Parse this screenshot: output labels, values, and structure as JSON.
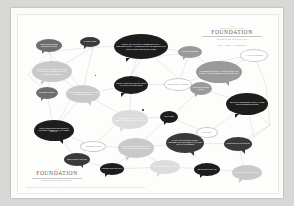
{
  "poster": {
    "header": {
      "logo_kicker": "THE",
      "logo_kicker2": "SOCIETY OF SHARED",
      "logo_word": "FOUNDATION",
      "logo_sub": "CONNECTING COMMUNITIES",
      "report_line": "2014 ANNUAL REPORT"
    },
    "footer": {
      "logo_kicker": "THE",
      "logo_word": "FOUNDATION",
      "logo_sub": "CONNECTING COMMUNITIES",
      "fine_print": "The Foundation Annual Report 2014  ·  For more information about our programmes, grants and partners please visit our website or contact the office."
    },
    "network": {
      "accent_dark": "#1d1d1d",
      "accent_mid": "#6e6e6e",
      "accent_light": "#c9c9c9",
      "line_color": "#cfcfcf",
      "node_label": "network-node"
    },
    "bubbles": [
      {
        "id": "b1",
        "shade": "s-mid",
        "x": 18,
        "y": 24,
        "w": 26,
        "h": 13,
        "fs": 1.7,
        "tail": "bl",
        "text": "WE BUILD STRONGER NEIGHBOURHOODS"
      },
      {
        "id": "b2",
        "shade": "s-dark2",
        "x": 62,
        "y": 22,
        "w": 20,
        "h": 10,
        "fs": 1.6,
        "tail": "bl",
        "text": "SHARED VOICES"
      },
      {
        "id": "b3",
        "shade": "s-dark",
        "x": 96,
        "y": 19,
        "w": 54,
        "h": 25,
        "fs": 2.0,
        "tail": "bl",
        "text": "EVERY GRANT WE MAKE BEGINS WITH A CONVERSATION — LISTENING TO THE PEOPLE WHO KNOW THEIR COMMUNITY BEST"
      },
      {
        "id": "b4",
        "shade": "s-grey",
        "x": 160,
        "y": 31,
        "w": 24,
        "h": 12,
        "fs": 1.7,
        "tail": "bl",
        "text": "LOCAL IDEAS FIRST"
      },
      {
        "id": "b5",
        "shade": "s-white",
        "x": 222,
        "y": 34,
        "w": 28,
        "h": 13,
        "fs": 1.7,
        "tail": "bl",
        "text": "A YEAR OF LISTENING"
      },
      {
        "id": "b6",
        "shade": "s-light",
        "x": 14,
        "y": 46,
        "w": 40,
        "h": 21,
        "fs": 1.9,
        "tail": "bl",
        "text": "WE FUND SMALL ORGANISATIONS DOING EXTRAORDINARY WORK ACROSS THE REGION"
      },
      {
        "id": "b7",
        "shade": "s-grey",
        "x": 178,
        "y": 46,
        "w": 46,
        "h": 22,
        "fs": 1.9,
        "tail": "br",
        "text": "PARTNERSHIP IS NOT A PROGRAMME, IT IS THE WAY WE CHOOSE TO WORK EVERY DAY"
      },
      {
        "id": "b8",
        "shade": "s-dark",
        "x": 96,
        "y": 61,
        "w": 34,
        "h": 18,
        "fs": 1.8,
        "tail": "bl",
        "text": "TRUST TAKES TIME AND WE ARE IN THIS FOR THE LONG TERM"
      },
      {
        "id": "b9",
        "shade": "s-white",
        "x": 146,
        "y": 63,
        "w": 28,
        "h": 13,
        "fs": 1.7,
        "tail": "bl",
        "text": "OPEN TO NEW PARTNERS"
      },
      {
        "id": "b10",
        "shade": "s-mid",
        "x": 18,
        "y": 72,
        "w": 22,
        "h": 12,
        "fs": 1.7,
        "tail": "bl",
        "text": "GRANTS MADE 2014"
      },
      {
        "id": "b11",
        "shade": "s-light",
        "x": 48,
        "y": 70,
        "w": 34,
        "h": 18,
        "fs": 1.8,
        "tail": "br",
        "text": "YOUNG PEOPLE LEADING CHANGE IN THEIR OWN TOWNS"
      },
      {
        "id": "b12",
        "shade": "s-grey",
        "x": 172,
        "y": 67,
        "w": 22,
        "h": 13,
        "fs": 1.7,
        "tail": "bl",
        "text": "SMALL GRANTS BIG IMPACT"
      },
      {
        "id": "b13",
        "shade": "s-dark",
        "x": 208,
        "y": 78,
        "w": 42,
        "h": 22,
        "fs": 1.8,
        "tail": "bl",
        "text": "WE BACK THE PEOPLE WHO STAY WHEN THE HEADLINES MOVE ON"
      },
      {
        "id": "b14",
        "shade": "s-pale",
        "x": 94,
        "y": 95,
        "w": 36,
        "h": 19,
        "fs": 1.8,
        "tail": "bl",
        "text": "A COMMUNITY THAT TALKS TO ITSELF IS A COMMUNITY THAT LASTS"
      },
      {
        "id": "b15",
        "shade": "s-dark",
        "x": 142,
        "y": 96,
        "w": 18,
        "h": 12,
        "fs": 1.6,
        "tail": "bl",
        "text": "OUR VALUES"
      },
      {
        "id": "b16",
        "shade": "s-dark",
        "x": 16,
        "y": 105,
        "w": 40,
        "h": 21,
        "fs": 1.8,
        "tail": "br",
        "text": "FROM FOOD BANKS TO FOOTBALL PITCHES, FUNDING WHAT MATTERS LOCALLY"
      },
      {
        "id": "b17",
        "shade": "s-white",
        "x": 178,
        "y": 112,
        "w": 22,
        "h": 11,
        "fs": 1.6,
        "tail": "bl",
        "text": "READ MORE"
      },
      {
        "id": "b18",
        "shade": "s-white",
        "x": 62,
        "y": 126,
        "w": 26,
        "h": 11,
        "fs": 1.6,
        "tail": "bl",
        "text": "VOLUNTEER HOURS"
      },
      {
        "id": "b19",
        "shade": "s-light",
        "x": 100,
        "y": 123,
        "w": 36,
        "h": 20,
        "fs": 1.8,
        "tail": "bl",
        "text": "WE MEASURE SUCCESS BY WHAT STAYS BEHIND AFTER WE LEAVE"
      },
      {
        "id": "b20",
        "shade": "s-dark2",
        "x": 148,
        "y": 118,
        "w": 38,
        "h": 20,
        "fs": 1.8,
        "tail": "br",
        "text": "THANK YOU TO EVERY DONOR, TRUSTEE AND VOLUNTEER WHO MADE THIS YEAR POSSIBLE"
      },
      {
        "id": "b21",
        "shade": "s-dark2",
        "x": 206,
        "y": 122,
        "w": 28,
        "h": 14,
        "fs": 1.7,
        "tail": "br",
        "text": "TOGETHER WE GO FURTHER"
      },
      {
        "id": "b22",
        "shade": "s-dark2",
        "x": 46,
        "y": 138,
        "w": 26,
        "h": 13,
        "fs": 1.7,
        "tail": "br",
        "text": "NEW FUNDS LAUNCHED"
      },
      {
        "id": "b23",
        "shade": "s-dark",
        "x": 82,
        "y": 148,
        "w": 24,
        "h": 12,
        "fs": 1.6,
        "tail": "bl",
        "text": "STORIES FROM THE YEAR"
      },
      {
        "id": "b24",
        "shade": "s-pale",
        "x": 132,
        "y": 145,
        "w": 30,
        "h": 14,
        "fs": 1.7,
        "tail": "bl",
        "text": "HOW WE SPEND EVERY POUND"
      },
      {
        "id": "b25",
        "shade": "s-dark",
        "x": 176,
        "y": 148,
        "w": 26,
        "h": 13,
        "fs": 1.7,
        "tail": "bl",
        "text": "GET IN TOUCH WITH US"
      },
      {
        "id": "b26",
        "shade": "s-light",
        "x": 214,
        "y": 150,
        "w": 30,
        "h": 15,
        "fs": 1.7,
        "tail": "bl",
        "text": "LOOKING AHEAD TO NEXT YEAR"
      }
    ],
    "edges": [
      [
        31,
        37,
        75,
        32
      ],
      [
        31,
        37,
        34,
        46
      ],
      [
        31,
        37,
        60,
        70
      ],
      [
        75,
        32,
        123,
        31
      ],
      [
        75,
        32,
        66,
        70
      ],
      [
        75,
        32,
        34,
        57
      ],
      [
        123,
        31,
        172,
        37
      ],
      [
        123,
        31,
        113,
        61
      ],
      [
        123,
        31,
        160,
        63
      ],
      [
        172,
        37,
        202,
        57
      ],
      [
        172,
        37,
        160,
        69
      ],
      [
        172,
        37,
        123,
        44
      ],
      [
        202,
        57,
        236,
        40
      ],
      [
        236,
        40,
        248,
        70
      ],
      [
        236,
        40,
        202,
        46
      ],
      [
        34,
        57,
        66,
        79
      ],
      [
        34,
        57,
        29,
        78
      ],
      [
        113,
        70,
        66,
        79
      ],
      [
        113,
        70,
        160,
        69
      ],
      [
        113,
        70,
        112,
        95
      ],
      [
        160,
        69,
        183,
        73
      ],
      [
        183,
        73,
        229,
        89
      ],
      [
        183,
        73,
        160,
        96
      ],
      [
        229,
        89,
        236,
        122
      ],
      [
        229,
        89,
        190,
        118
      ],
      [
        29,
        78,
        36,
        115
      ],
      [
        66,
        79,
        36,
        115
      ],
      [
        66,
        79,
        112,
        104
      ],
      [
        112,
        104,
        151,
        102
      ],
      [
        151,
        102,
        190,
        118
      ],
      [
        151,
        102,
        118,
        133
      ],
      [
        36,
        115,
        75,
        131
      ],
      [
        75,
        131,
        118,
        133
      ],
      [
        118,
        133,
        167,
        128
      ],
      [
        167,
        128,
        190,
        118
      ],
      [
        167,
        128,
        220,
        129
      ],
      [
        220,
        129,
        236,
        122
      ],
      [
        59,
        144,
        36,
        115
      ],
      [
        59,
        144,
        94,
        154
      ],
      [
        94,
        154,
        118,
        133
      ],
      [
        94,
        154,
        147,
        152
      ],
      [
        147,
        152,
        189,
        154
      ],
      [
        189,
        154,
        227,
        157
      ],
      [
        227,
        157,
        220,
        129
      ],
      [
        189,
        154,
        167,
        128
      ],
      [
        147,
        152,
        118,
        133
      ],
      [
        31,
        37,
        10,
        60
      ],
      [
        248,
        70,
        252,
        110
      ],
      [
        252,
        110,
        229,
        89
      ],
      [
        252,
        110,
        220,
        129
      ],
      [
        10,
        60,
        29,
        78
      ],
      [
        123,
        44,
        113,
        61
      ],
      [
        60,
        70,
        36,
        115
      ],
      [
        202,
        57,
        160,
        69
      ],
      [
        236,
        122,
        252,
        110
      ],
      [
        112,
        95,
        75,
        131
      ]
    ]
  }
}
